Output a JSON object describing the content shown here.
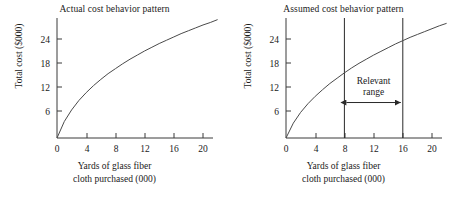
{
  "figure": {
    "background_color": "#ffffff",
    "line_color": "#3a3a3a",
    "text_color": "#1a1a1a"
  },
  "chart_data": [
    {
      "type": "line",
      "title": "Actual cost behavior pattern",
      "xlabel_line1": "Yards of glass fiber",
      "xlabel_line2": "cloth purchased (000)",
      "ylabel": "Total cost ($000)",
      "xlim": [
        0,
        22
      ],
      "ylim": [
        0,
        30
      ],
      "xticks": [
        0,
        4,
        8,
        12,
        16,
        20
      ],
      "xtick_labels": [
        "0",
        "4",
        "8",
        "12",
        "16",
        "20"
      ],
      "yticks": [
        6,
        12,
        18,
        24
      ],
      "ytick_labels": [
        "6",
        "12",
        "18",
        "24"
      ],
      "grid": false,
      "legend": "none",
      "series": [
        {
          "name": "Actual total cost",
          "shape": "concave-increasing",
          "x": [
            0,
            1,
            2,
            3,
            4,
            5,
            6,
            7,
            8,
            9,
            10,
            11,
            12,
            13,
            14,
            15,
            16,
            17,
            18,
            19,
            20,
            21,
            22
          ],
          "y": [
            0.0,
            4.0,
            6.8,
            9.1,
            11.0,
            12.7,
            14.2,
            15.6,
            16.8,
            18.0,
            19.1,
            20.1,
            21.1,
            22.0,
            22.9,
            23.7,
            24.5,
            25.3,
            26.0,
            26.7,
            27.4,
            28.0,
            28.7
          ]
        }
      ]
    },
    {
      "type": "line",
      "title": "Assumed cost behavior pattern",
      "xlabel_line1": "Yards of glass fiber",
      "xlabel_line2": "cloth purchased (000)",
      "ylabel": "Total cost ($000)",
      "xlim": [
        0,
        22
      ],
      "ylim": [
        0,
        30
      ],
      "xticks": [
        0,
        4,
        8,
        12,
        16,
        20
      ],
      "xtick_labels": [
        "0",
        "4",
        "8",
        "12",
        "16",
        "20"
      ],
      "yticks": [
        6,
        12,
        18,
        24
      ],
      "ytick_labels": [
        "6",
        "12",
        "18",
        "24"
      ],
      "grid": false,
      "legend": "none",
      "series": [
        {
          "name": "Assumed total cost",
          "shape": "concave-increasing",
          "x": [
            0,
            1,
            2,
            3,
            4,
            5,
            6,
            7,
            8,
            9,
            10,
            11,
            12,
            13,
            14,
            15,
            16,
            17,
            18,
            19,
            20,
            21,
            22
          ],
          "y": [
            0.0,
            3.6,
            6.2,
            8.3,
            10.1,
            11.7,
            13.2,
            14.5,
            15.8,
            17.0,
            18.1,
            19.1,
            20.1,
            21.0,
            21.9,
            22.8,
            23.6,
            24.4,
            25.1,
            25.8,
            26.5,
            27.2,
            27.8
          ]
        }
      ],
      "annotations": {
        "relevant_range": {
          "label_line1": "Relevant",
          "label_line2": "range",
          "x_start": 8,
          "x_end": 16,
          "arrow_y_value": 8.6,
          "style": "double-headed-arrow-between-vertical-lines"
        }
      }
    }
  ]
}
